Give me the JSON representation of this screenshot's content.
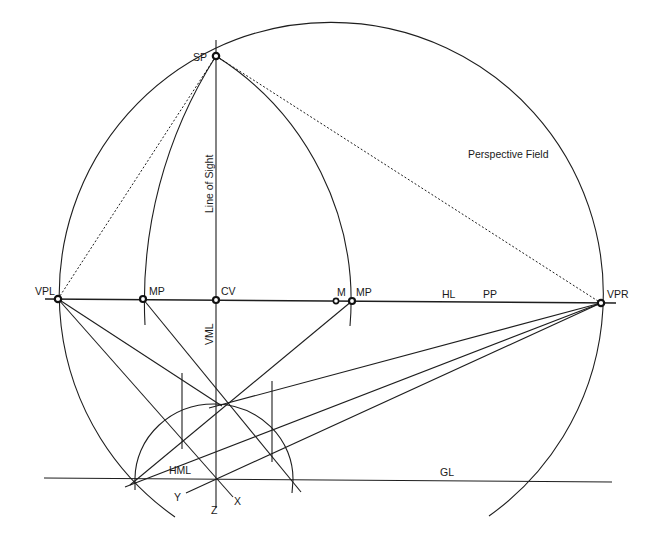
{
  "diagram": {
    "type": "two-point perspective construction",
    "labels": {
      "sp": "SP",
      "line_of_sight": "Line of Sight",
      "perspective_field": "Perspective Field",
      "vpl": "VPL",
      "vpr": "VPR",
      "mp_left": "MP",
      "cv": "CV",
      "m": "M",
      "mp_right": "MP",
      "hl": "HL",
      "pp": "PP",
      "vml": "VML",
      "hml": "HML",
      "gl": "GL",
      "x_axis": "X",
      "y_axis": "Y",
      "z_axis": "Z"
    },
    "points": {
      "SP": [
        216,
        56
      ],
      "VPL": [
        58,
        299
      ],
      "VPR": [
        601,
        303
      ],
      "MP_left": [
        143,
        299
      ],
      "CV": [
        216,
        300
      ],
      "M": [
        336,
        301
      ],
      "MP_right": [
        352,
        301
      ],
      "Z_origin": [
        216,
        479
      ]
    },
    "colors": {
      "ink": "#1e1e1e",
      "background": "#ffffff"
    }
  }
}
